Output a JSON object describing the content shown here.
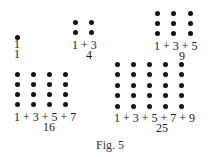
{
  "figure": {
    "caption": "Fig. 5",
    "groups": [
      {
        "n": 1,
        "sum_label": "1",
        "total": "1",
        "origin": [
          17,
          37
        ],
        "spacing": [
          16,
          10
        ],
        "label_pos": [
          14,
          38
        ],
        "total_pos": [
          14,
          48
        ]
      },
      {
        "n": 2,
        "sum_label": "1 + 3",
        "total": "4",
        "origin": [
          75,
          22
        ],
        "spacing": [
          16,
          10
        ],
        "label_pos": [
          72,
          39
        ],
        "total_pos": [
          86,
          49
        ]
      },
      {
        "n": 3,
        "sum_label": "1 + 3 + 5",
        "total": "9",
        "origin": [
          157,
          13
        ],
        "spacing": [
          16.5,
          10
        ],
        "label_pos": [
          154,
          40
        ],
        "total_pos": [
          179,
          50
        ]
      },
      {
        "n": 4,
        "sum_label": "1 + 3 + 5 + 7",
        "total": "16",
        "origin": [
          17,
          74
        ],
        "spacing": [
          16,
          10.3
        ],
        "label_pos": [
          14,
          111
        ],
        "total_pos": [
          43,
          121
        ]
      },
      {
        "n": 5,
        "sum_label": "1 + 3 + 5 + 7 + 9",
        "total": "25",
        "origin": [
          117,
          64
        ],
        "spacing": [
          16,
          10.5
        ],
        "label_pos": [
          114,
          112
        ],
        "total_pos": [
          156,
          122
        ]
      }
    ]
  }
}
